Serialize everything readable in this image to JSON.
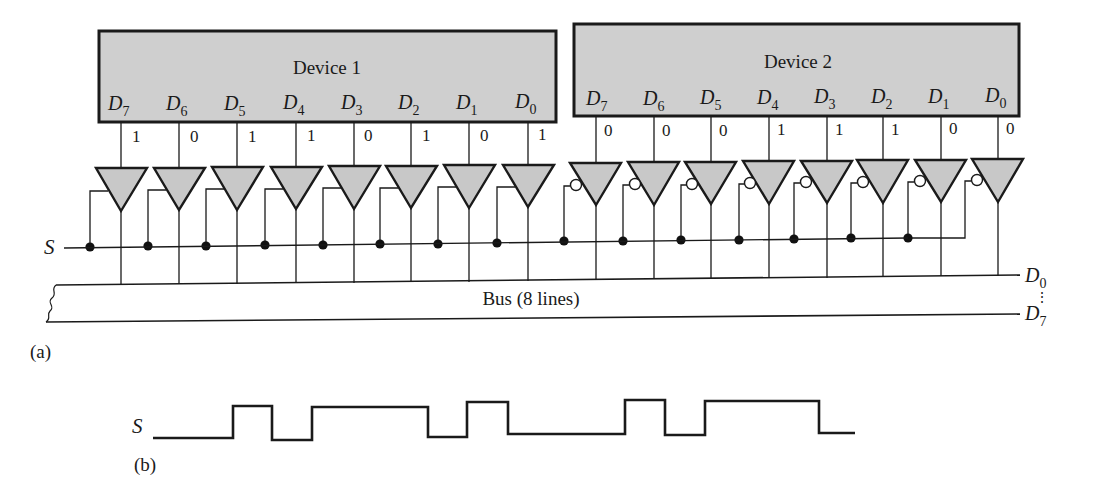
{
  "figure": {
    "part_a_label": "(a)",
    "part_b_label": "(b)"
  },
  "colors": {
    "device_fill": "#cfcfcf",
    "buffer_fill": "#c8c8c8",
    "line": "#1a1a1a"
  },
  "devices": [
    {
      "name": "Device 1",
      "pins": [
        "D7",
        "D6",
        "D5",
        "D4",
        "D3",
        "D2",
        "D1",
        "D0"
      ],
      "pin_letters": [
        "D",
        "D",
        "D",
        "D",
        "D",
        "D",
        "D",
        "D"
      ],
      "pin_subscripts": [
        "7",
        "6",
        "5",
        "4",
        "3",
        "2",
        "1",
        "0"
      ],
      "bits": [
        "1",
        "0",
        "1",
        "1",
        "0",
        "1",
        "0",
        "1"
      ],
      "buffer_enable": "active-high"
    },
    {
      "name": "Device 2",
      "pins": [
        "D7",
        "D6",
        "D5",
        "D4",
        "D3",
        "D2",
        "D1",
        "D0"
      ],
      "pin_letters": [
        "D",
        "D",
        "D",
        "D",
        "D",
        "D",
        "D",
        "D"
      ],
      "pin_subscripts": [
        "7",
        "6",
        "5",
        "4",
        "3",
        "2",
        "1",
        "0"
      ],
      "bits": [
        "0",
        "0",
        "0",
        "1",
        "1",
        "1",
        "0",
        "0"
      ],
      "buffer_enable": "active-low"
    }
  ],
  "select_signal": {
    "label": "S"
  },
  "bus": {
    "label": "Bus (8 lines)",
    "top_line": {
      "letter": "D",
      "subscript": "0"
    },
    "bottom_line": {
      "letter": "D",
      "subscript": "7"
    },
    "ellipsis": "⋮"
  },
  "waveform": {
    "label": "S",
    "levels": [
      "L",
      "H",
      "L",
      "H",
      "L",
      "H",
      "L",
      "H",
      "L",
      "H",
      "L"
    ]
  }
}
